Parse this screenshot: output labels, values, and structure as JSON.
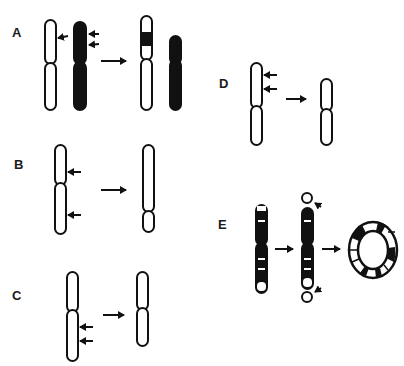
{
  "figure": {
    "panels": [
      {
        "id": "A",
        "label": "A",
        "description": "Translocation/insertion: segment from dark homolog inserted into light chromosome"
      },
      {
        "id": "B",
        "label": "B",
        "description": "Pericentric breakage: two breakpoints spanning centromere, rearranged chromosome"
      },
      {
        "id": "C",
        "label": "C",
        "description": "Interstitial deletion on long arm"
      },
      {
        "id": "D",
        "label": "D",
        "description": "Interstitial deletion on short arm"
      },
      {
        "id": "E",
        "label": "E",
        "description": "Ring chromosome formation: terminal breaks at both ends, acentric fragments lost, ends fuse into ring"
      }
    ],
    "colors": {
      "stroke": "#111111",
      "fill_dark": "#111111",
      "fill_light": "#ffffff",
      "background": "#ffffff"
    }
  }
}
